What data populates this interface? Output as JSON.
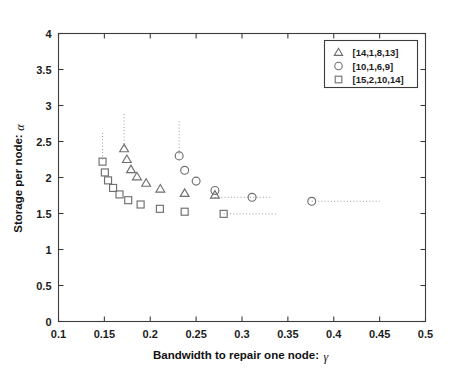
{
  "chart_data": {
    "type": "scatter",
    "title": "",
    "xlabel": "Bandwidth to repair one node:",
    "xlabel_symbol": "γ",
    "ylabel": "Storage per node:",
    "ylabel_symbol": "α",
    "xlim": [
      0.1,
      0.5
    ],
    "ylim": [
      0,
      4
    ],
    "xticks": [
      0.1,
      0.15,
      0.2,
      0.25,
      0.3,
      0.35,
      0.4,
      0.45,
      0.5
    ],
    "xticklabels": [
      "0.1",
      "0.15",
      "0.2",
      "0.25",
      "0.3",
      "0.35",
      "0.4",
      "0.45",
      "0.5"
    ],
    "yticks": [
      0,
      0.5,
      1,
      1.5,
      2,
      2.5,
      3,
      3.5,
      4
    ],
    "yticklabels": [
      "0",
      "0.5",
      "1",
      "1.5",
      "2",
      "2.5",
      "3",
      "3.5",
      "4"
    ],
    "grid": false,
    "legend_position": "upper right",
    "series": [
      {
        "name": "[14,1,8,13]",
        "marker": "triangle",
        "points": [
          {
            "x": 0.1715,
            "y": 2.4
          },
          {
            "x": 0.1745,
            "y": 2.25
          },
          {
            "x": 0.179,
            "y": 2.11
          },
          {
            "x": 0.1855,
            "y": 2.01
          },
          {
            "x": 0.1955,
            "y": 1.92
          },
          {
            "x": 0.211,
            "y": 1.84
          },
          {
            "x": 0.2375,
            "y": 1.78
          },
          {
            "x": 0.2705,
            "y": 1.755
          }
        ],
        "vertical_guide": {
          "x": 0.1715,
          "y_top": 2.88,
          "y_bottom": 2.4
        },
        "horizontal_guide": null
      },
      {
        "name": "[10,1,6,9]",
        "marker": "circle",
        "points": [
          {
            "x": 0.2315,
            "y": 2.3
          },
          {
            "x": 0.2375,
            "y": 2.1
          },
          {
            "x": 0.25,
            "y": 1.95
          },
          {
            "x": 0.2705,
            "y": 1.82
          },
          {
            "x": 0.311,
            "y": 1.725
          },
          {
            "x": 0.376,
            "y": 1.67
          }
        ],
        "vertical_guide": {
          "x": 0.2315,
          "y_top": 2.78,
          "y_bottom": 2.3
        },
        "horizontal_guides": [
          {
            "y": 1.725,
            "x_start": 0.2705,
            "x_end": 0.333
          },
          {
            "y": 1.67,
            "x_start": 0.376,
            "x_end": 0.45
          }
        ]
      },
      {
        "name": "[15,2,10,14]",
        "marker": "square",
        "points": [
          {
            "x": 0.148,
            "y": 2.22
          },
          {
            "x": 0.1505,
            "y": 2.07
          },
          {
            "x": 0.154,
            "y": 1.96
          },
          {
            "x": 0.1595,
            "y": 1.855
          },
          {
            "x": 0.1665,
            "y": 1.765
          },
          {
            "x": 0.176,
            "y": 1.685
          },
          {
            "x": 0.1895,
            "y": 1.625
          },
          {
            "x": 0.2105,
            "y": 1.565
          },
          {
            "x": 0.2375,
            "y": 1.525
          },
          {
            "x": 0.28,
            "y": 1.495
          }
        ],
        "vertical_guide": {
          "x": 0.148,
          "y_top": 2.62,
          "y_bottom": 2.22
        },
        "horizontal_guides": [
          {
            "y": 1.495,
            "x_start": 0.28,
            "x_end": 0.338
          }
        ]
      }
    ]
  },
  "legend": {
    "entries": [
      {
        "marker": "triangle",
        "label": "[14,1,8,13]"
      },
      {
        "marker": "circle",
        "label": "[10,1,6,9]"
      },
      {
        "marker": "square",
        "label": "[15,2,10,14]"
      }
    ]
  },
  "colors": {
    "background": "#ffffff",
    "axis": "#3c3c3c",
    "marker": "#6e6e6e",
    "guide": "#9a9a9a",
    "text": "#1c1c1c"
  }
}
